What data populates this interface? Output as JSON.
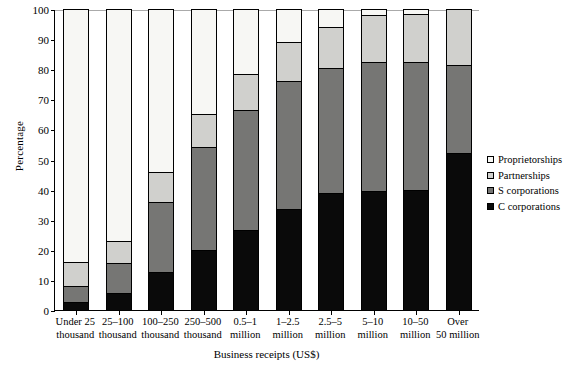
{
  "chart_data": {
    "type": "bar",
    "subtype": "stacked-bar-100-percent",
    "title": "",
    "xlabel": "Business receipts (US$)",
    "ylabel": "Percentage",
    "ylim": [
      0,
      100
    ],
    "yticks": [
      0,
      10,
      20,
      30,
      40,
      50,
      60,
      70,
      80,
      90,
      100
    ],
    "grid": false,
    "legend_position": "right",
    "categories": [
      "Under 25 thousand",
      "25–100 thousand",
      "100–250 thousand",
      "250–500 thousand",
      "0.5–1 million",
      "1–2.5 million",
      "2.5–5 million",
      "5–10 million",
      "10–50 million",
      "Over 50 million"
    ],
    "category_lines": [
      [
        "Under 25",
        "thousand"
      ],
      [
        "25–100",
        "thousand"
      ],
      [
        "100–250",
        "thousand"
      ],
      [
        "250–500",
        "thousand"
      ],
      [
        "0.5–1",
        "million"
      ],
      [
        "1–2.5",
        "million"
      ],
      [
        "2.5–5",
        "million"
      ],
      [
        "5–10",
        "million"
      ],
      [
        "10–50",
        "million"
      ],
      [
        "Over",
        "50 million"
      ]
    ],
    "stack_order_bottom_to_top": [
      "C corporations",
      "S corporations",
      "Partnerships",
      "Proprietorships"
    ],
    "series": [
      {
        "name": "C corporations",
        "color": "#0a0a0a",
        "values": [
          2.5,
          5.5,
          12.5,
          20.0,
          26.5,
          33.5,
          39.0,
          39.5,
          40.0,
          52.0
        ]
      },
      {
        "name": "S corporations",
        "color": "#767674",
        "values": [
          5.5,
          10.0,
          23.5,
          34.0,
          40.0,
          42.5,
          41.5,
          43.0,
          42.5,
          29.5
        ]
      },
      {
        "name": "Partnerships",
        "color": "#d0d0cd",
        "values": [
          8.0,
          7.5,
          10.0,
          11.0,
          12.0,
          13.0,
          13.5,
          15.5,
          16.0,
          18.5
        ]
      },
      {
        "name": "Proprietorships",
        "color": "#f7f7f4",
        "values": [
          84.0,
          77.0,
          54.0,
          35.0,
          21.5,
          11.0,
          6.0,
          2.0,
          1.5,
          0.0
        ]
      }
    ],
    "cumulative_tops": [
      [
        2.5,
        8.0,
        16.0,
        100.0
      ],
      [
        5.5,
        15.5,
        23.0,
        100.0
      ],
      [
        12.5,
        36.0,
        46.0,
        100.0
      ],
      [
        20.0,
        54.0,
        65.0,
        100.0
      ],
      [
        26.5,
        66.5,
        78.5,
        100.0
      ],
      [
        33.5,
        76.0,
        89.0,
        100.0
      ],
      [
        39.0,
        80.5,
        94.0,
        100.0
      ],
      [
        39.5,
        82.5,
        98.0,
        100.0
      ],
      [
        40.0,
        82.5,
        98.5,
        100.0
      ],
      [
        52.0,
        81.5,
        100.0,
        100.0
      ]
    ]
  },
  "legend": {
    "items": [
      {
        "label": "Proprietorships",
        "color": "#f7f7f4",
        "swatch": "open-square-icon"
      },
      {
        "label": "Partnerships",
        "color": "#d0d0cd",
        "swatch": "light-gray-square-icon"
      },
      {
        "label": "S corporations",
        "color": "#767674",
        "swatch": "gray-square-icon"
      },
      {
        "label": "C corporations",
        "color": "#0a0a0a",
        "swatch": "black-square-icon"
      }
    ]
  },
  "axes": {
    "y_title": "Percentage",
    "x_title": "Business receipts (US$)",
    "y_tick_labels": [
      "0",
      "10",
      "20",
      "30",
      "40",
      "50",
      "60",
      "70",
      "80",
      "90",
      "100"
    ]
  }
}
